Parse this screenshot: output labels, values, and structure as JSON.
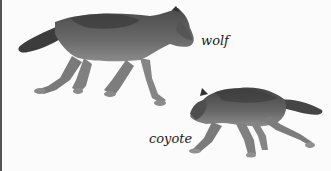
{
  "illustration": {
    "labels": {
      "wolf": "wolf",
      "coyote": "coyote"
    },
    "colors": {
      "background": "#fbfbfb",
      "fur_dark": "#3f3f3f",
      "fur_mid": "#6e6e6e",
      "fur_light": "#9a9a9a",
      "border": "#555555"
    }
  }
}
